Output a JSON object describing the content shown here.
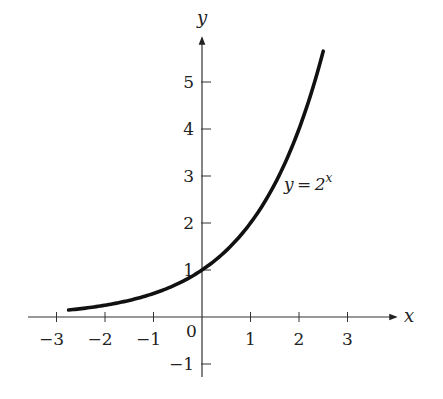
{
  "chart_data": {
    "type": "line",
    "title": "",
    "xlabel": "x",
    "ylabel": "y",
    "xlim": [
      -3.5,
      4
    ],
    "ylim": [
      -1.3,
      6
    ],
    "grid": false,
    "legend": null,
    "x_ticks": [
      -3,
      -2,
      -1,
      1,
      2,
      3
    ],
    "x_tick_labels": [
      "−3",
      "−2",
      "−1",
      "1",
      "2",
      "3"
    ],
    "y_ticks": [
      -1,
      1,
      2,
      3,
      4,
      5
    ],
    "y_tick_labels": [
      "−1",
      "1",
      "2",
      "3",
      "4",
      "5"
    ],
    "origin_label": "0",
    "series": [
      {
        "name": "y = 2^x",
        "function": "2^x",
        "x_range": [
          -2.75,
          2.5
        ],
        "x": [
          -2.75,
          -2.5,
          -2,
          -1.5,
          -1,
          -0.5,
          0,
          0.5,
          1,
          1.5,
          2,
          2.5
        ],
        "y": [
          0.149,
          0.177,
          0.25,
          0.354,
          0.5,
          0.707,
          1,
          1.414,
          2,
          2.828,
          4,
          5.657
        ]
      }
    ],
    "annotations": [
      {
        "text_prefix": "y = 2",
        "text_sup": "x",
        "x": 1.75,
        "y": 2.9
      }
    ]
  }
}
